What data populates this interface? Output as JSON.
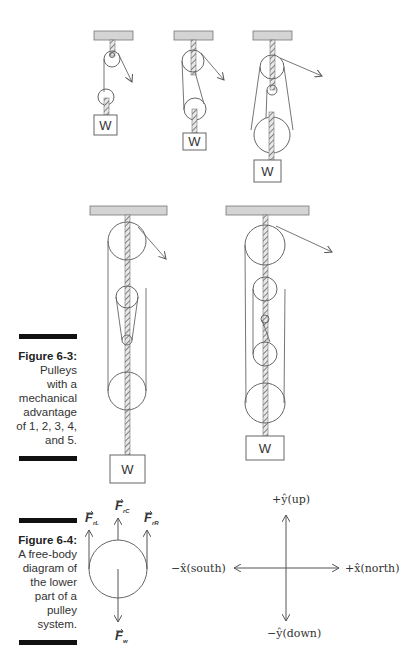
{
  "figure_6_3": {
    "caption_title": "Figure 6-3:",
    "caption_lines": [
      "Pulleys",
      "with a",
      "mechanical",
      "advantage",
      "of 1, 2, 3, 4,",
      "and 5."
    ],
    "weight_label": "W",
    "mechanical_advantages": [
      1,
      2,
      3,
      4,
      5
    ]
  },
  "figure_6_4": {
    "caption_title": "Figure 6-4:",
    "caption_lines": [
      "A free-body",
      "diagram of",
      "the lower",
      "part of a",
      "pulley",
      "system."
    ],
    "forces": {
      "left": {
        "symbol": "F",
        "sub": "rL"
      },
      "center": {
        "symbol": "F",
        "sub": "rC"
      },
      "right": {
        "symbol": "F",
        "sub": "rR"
      },
      "weight": {
        "symbol": "F",
        "sub": "w"
      }
    },
    "axes": {
      "up": "+ŷ(up)",
      "down": "−ŷ(down)",
      "north": "+x̂(north)",
      "south": "−x̂(south)"
    }
  }
}
